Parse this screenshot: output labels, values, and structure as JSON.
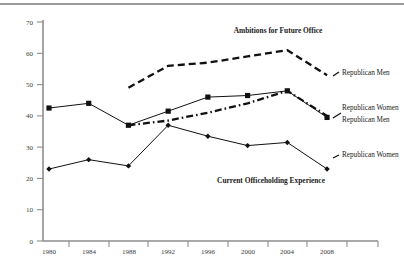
{
  "chart_data": {
    "type": "line",
    "title": "",
    "xlabel": "",
    "ylabel": "",
    "grid": false,
    "legend_position": "right-inline",
    "categories": [
      "1980",
      "1984",
      "1988",
      "1992",
      "1996",
      "2000",
      "2004",
      "2008"
    ],
    "x": [
      1980,
      1984,
      1988,
      1992,
      1996,
      2000,
      2004,
      2008
    ],
    "ylim": [
      0,
      70
    ],
    "yticks": [
      0,
      10,
      20,
      30,
      40,
      50,
      60,
      70
    ],
    "ytick_labels": [
      "0",
      "10",
      "20",
      "30",
      "40",
      "50",
      "60",
      "70"
    ],
    "annotations": [
      {
        "text": "Ambitions for Future Office",
        "x": 1997.5,
        "y": 66.5
      },
      {
        "text": "Current Officeholding Experience",
        "x": 1998.5,
        "y": 19.5
      }
    ],
    "series": [
      {
        "name": "Republican Men",
        "group": "Ambitions for Future Office",
        "style": "dashed",
        "marker": "none",
        "color": "#111111",
        "categories": [
          "1988",
          "1992",
          "1996",
          "2000",
          "2004",
          "2008"
        ],
        "x": [
          1988,
          1992,
          1996,
          2000,
          2004,
          2008
        ],
        "values": [
          49,
          56,
          57,
          59,
          61,
          53
        ],
        "label": "Republican Men",
        "label_x": 2009.3,
        "label_y": 54
      },
      {
        "name": "Republican Women",
        "group": "Ambitions for Future Office",
        "style": "dash-dot",
        "marker": "none",
        "color": "#111111",
        "categories": [
          "1988",
          "1992",
          "1996",
          "2000",
          "2004",
          "2008"
        ],
        "x": [
          1988,
          1992,
          1996,
          2000,
          2004,
          2008
        ],
        "values": [
          37,
          38.5,
          41,
          44,
          48,
          40
        ],
        "label": "Republican Women",
        "label_x": 2009.3,
        "label_y": 43
      },
      {
        "name": "Republican Men",
        "group": "Current Officeholding Experience",
        "style": "solid",
        "marker": "square",
        "color": "#111111",
        "categories": [
          "1980",
          "1984",
          "1988",
          "1992",
          "1996",
          "2000",
          "2004",
          "2008"
        ],
        "x": [
          1980,
          1984,
          1988,
          1992,
          1996,
          2000,
          2004,
          2008
        ],
        "values": [
          42.5,
          44,
          37,
          41.5,
          46,
          46.5,
          48,
          39.5
        ],
        "label": "Republican Men",
        "label_x": 2009.3,
        "label_y": 38.5
      },
      {
        "name": "Republican Women",
        "group": "Current Officeholding Experience",
        "style": "solid",
        "marker": "diamond",
        "color": "#111111",
        "categories": [
          "1980",
          "1984",
          "1988",
          "1992",
          "1996",
          "2000",
          "2004",
          "2008"
        ],
        "x": [
          1980,
          1984,
          1988,
          1992,
          1996,
          2000,
          2004,
          2008
        ],
        "values": [
          23,
          26,
          24,
          37,
          33.5,
          30.5,
          31.5,
          23
        ],
        "label": "Republican Women",
        "label_x": 2009.3,
        "label_y": 26.5
      }
    ]
  },
  "axis": {
    "y_tick_labels": [
      "70",
      "60",
      "50",
      "40",
      "30",
      "20",
      "10",
      "0"
    ],
    "x_tick_labels": [
      "1980",
      "1984",
      "1988",
      "1992",
      "1996",
      "2000",
      "2004",
      "2008"
    ]
  },
  "annotations": {
    "ambitions": "Ambitions for Future Office",
    "officeholding": "Current Officeholding Experience"
  },
  "series_labels": {
    "ambitions_men": "Republican Men",
    "ambitions_women": "Republican Women",
    "office_men": "Republican Men",
    "office_women": "Republican Women"
  },
  "colors": {
    "line": "#111111",
    "axis": "#8d8d8d",
    "tick_text": "#3a3a3a",
    "background": "#ffffff",
    "top_rule": "#9a9a9a"
  }
}
